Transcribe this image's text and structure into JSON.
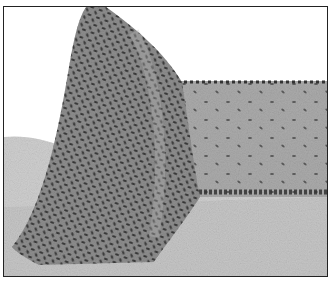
{
  "image": {
    "description": "Grayscale illustration of a particle-coated structure: a tall conical mound on the left joined to a flat raised slab extending to the right, resting on a textured gray surface",
    "colors": {
      "background": "#ffffff",
      "ground": "#c8c8c8",
      "slab": "#a9a9a9",
      "mound": "#8f8f8f",
      "particle": "#3a3a3a",
      "border": "#222222"
    }
  }
}
